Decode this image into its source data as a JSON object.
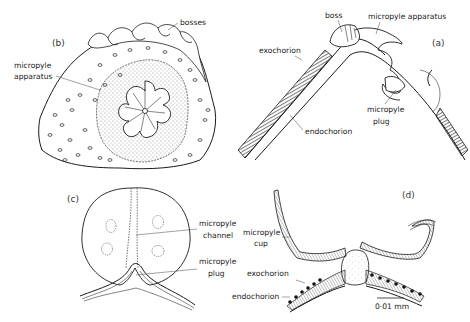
{
  "figure": {
    "panels": [
      {
        "id": "b",
        "label": "(b)",
        "annotations": [
          "bosses",
          "micropyle",
          "apparatus"
        ]
      },
      {
        "id": "a",
        "label": "(a)",
        "annotations": [
          "boss",
          "micropyle  apparatus",
          "exochorion",
          "endochorion",
          "micropyle",
          "plug"
        ]
      },
      {
        "id": "c",
        "label": "(c)",
        "annotations": [
          "micropyle",
          "channel",
          "micropyle",
          "plug"
        ]
      },
      {
        "id": "d",
        "label": "(d)",
        "annotations": [
          "micropyle",
          "cup",
          "exochorion",
          "endochorion"
        ],
        "scale_bar": "0·01 mm"
      }
    ]
  }
}
